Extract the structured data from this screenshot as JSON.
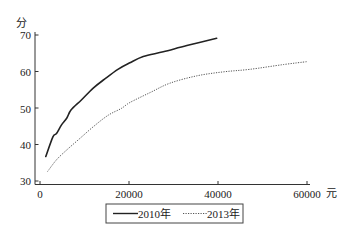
{
  "chart_data": {
    "type": "line",
    "title": "",
    "ylabel": "分",
    "xlabel": "元",
    "xlim": [
      0,
      60000
    ],
    "ylim": [
      30,
      70
    ],
    "x_ticks": [
      0,
      20000,
      40000,
      60000
    ],
    "x_tick_labels": [
      "0",
      "20000",
      "40000",
      "60000"
    ],
    "y_ticks": [
      30,
      40,
      50,
      60,
      70
    ],
    "y_tick_labels": [
      "30",
      "40",
      "50",
      "60",
      "70"
    ],
    "grid": false,
    "legend_position": "bottom-center",
    "series": [
      {
        "name": "2010年",
        "style": "solid",
        "color": "#222222",
        "points": [
          [
            1300,
            36.7
          ],
          [
            2900,
            42.1
          ],
          [
            3700,
            43.0
          ],
          [
            4800,
            45.3
          ],
          [
            6000,
            47.2
          ],
          [
            7000,
            49.5
          ],
          [
            9300,
            52.2
          ],
          [
            11900,
            55.4
          ],
          [
            14500,
            57.9
          ],
          [
            17500,
            60.6
          ],
          [
            20200,
            62.4
          ],
          [
            23200,
            64.1
          ],
          [
            27700,
            65.4
          ],
          [
            33000,
            67.1
          ],
          [
            39700,
            69.1
          ]
        ]
      },
      {
        "name": "2013年",
        "style": "dotted",
        "color": "#555555",
        "points": [
          [
            1700,
            32.6
          ],
          [
            3700,
            35.8
          ],
          [
            6000,
            38.5
          ],
          [
            9000,
            41.7
          ],
          [
            12000,
            44.9
          ],
          [
            15300,
            48.0
          ],
          [
            18300,
            49.9
          ],
          [
            20200,
            51.5
          ],
          [
            24700,
            54.2
          ],
          [
            29200,
            56.8
          ],
          [
            35200,
            58.8
          ],
          [
            41200,
            59.9
          ],
          [
            47200,
            60.6
          ],
          [
            54700,
            61.9
          ],
          [
            60000,
            62.7
          ]
        ]
      }
    ]
  },
  "axes": {
    "y_unit": "分",
    "x_unit": "元",
    "y_labels": [
      "70",
      "60",
      "50",
      "40",
      "30"
    ],
    "x_labels": [
      "0",
      "20000",
      "40000",
      "60000"
    ]
  },
  "legend": {
    "items": [
      {
        "label": "2010年",
        "style": "solid"
      },
      {
        "label": "2013年",
        "style": "dotted"
      }
    ]
  }
}
